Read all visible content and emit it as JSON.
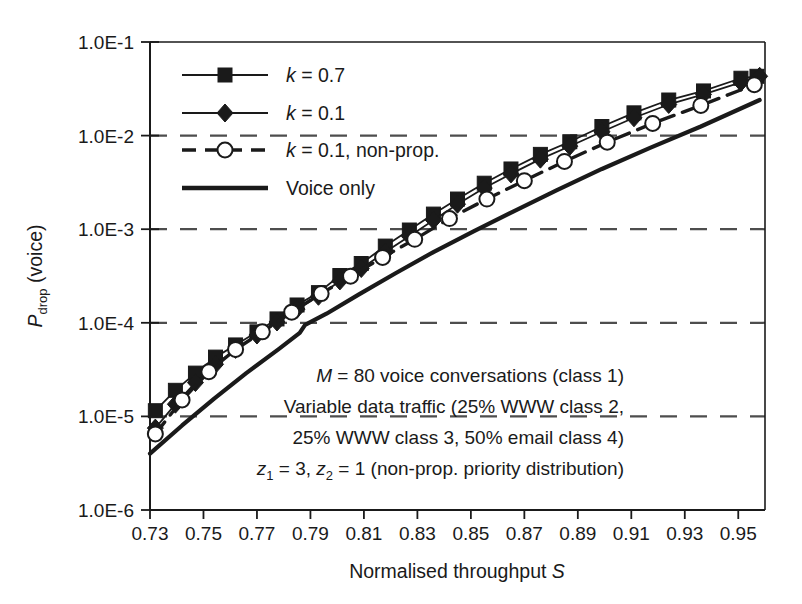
{
  "chart_data": {
    "type": "line",
    "title": "",
    "xlabel": "Normalised throughput S",
    "ylabel": "P_drop (voice)",
    "ylabel_parts": {
      "main": "P",
      "subscript": "drop",
      "suffix": " (voice)"
    },
    "xlim": [
      0.73,
      0.96
    ],
    "ylim": [
      1e-06,
      0.1
    ],
    "yscale": "log",
    "grid": "horizontal-dashed",
    "xticks": [
      "0.73",
      "0.75",
      "0.77",
      "0.79",
      "0.81",
      "0.83",
      "0.85",
      "0.87",
      "0.89",
      "0.91",
      "0.93",
      "0.95"
    ],
    "xtick_values": [
      0.73,
      0.75,
      0.77,
      0.79,
      0.81,
      0.83,
      0.85,
      0.87,
      0.89,
      0.91,
      0.93,
      0.95
    ],
    "yticks": [
      "1.0E-1",
      "1.0E-2",
      "1.0E-3",
      "1.0E-4",
      "1.0E-5",
      "1.0E-6"
    ],
    "ytick_values": [
      0.1,
      0.01,
      0.001,
      0.0001,
      1e-05,
      1e-06
    ],
    "legend_position": "upper-left-inside",
    "series": [
      {
        "name": "k = 0.7",
        "label_parts": {
          "symbol": "k",
          "rest": " = 0.7"
        },
        "marker": "square-filled",
        "linestyle": "solid",
        "color": "#1a1a1a",
        "x": [
          0.732,
          0.7395,
          0.747,
          0.7545,
          0.762,
          0.77,
          0.7775,
          0.785,
          0.793,
          0.801,
          0.809,
          0.818,
          0.827,
          0.836,
          0.845,
          0.855,
          0.865,
          0.876,
          0.887,
          0.899,
          0.911,
          0.924,
          0.937,
          0.951,
          0.957
        ],
        "y": [
          1.15e-05,
          1.9e-05,
          2.9e-05,
          4.3e-05,
          5.8e-05,
          8e-05,
          0.00011,
          0.000155,
          0.00021,
          0.00032,
          0.00043,
          0.00066,
          0.00098,
          0.00145,
          0.0021,
          0.0031,
          0.0044,
          0.0063,
          0.0086,
          0.0125,
          0.0175,
          0.024,
          0.03,
          0.041,
          0.043
        ]
      },
      {
        "name": "k = 0.1",
        "label_parts": {
          "symbol": "k",
          "rest": " = 0.1"
        },
        "marker": "diamond-filled",
        "linestyle": "solid",
        "color": "#1a1a1a",
        "x": [
          0.732,
          0.7395,
          0.747,
          0.7545,
          0.762,
          0.77,
          0.7775,
          0.785,
          0.793,
          0.801,
          0.809,
          0.818,
          0.827,
          0.836,
          0.845,
          0.855,
          0.865,
          0.876,
          0.887,
          0.899,
          0.911,
          0.924,
          0.937,
          0.951,
          0.958
        ],
        "y": [
          7.5e-06,
          1.35e-05,
          2.3e-05,
          3.6e-05,
          5.2e-05,
          7.4e-05,
          0.000102,
          0.00014,
          0.000192,
          0.00028,
          0.00038,
          0.00057,
          0.00084,
          0.00125,
          0.00185,
          0.00275,
          0.0039,
          0.0056,
          0.0077,
          0.011,
          0.0155,
          0.0215,
          0.0275,
          0.037,
          0.043
        ]
      },
      {
        "name": "k = 0.1, non-prop.",
        "label_parts": {
          "symbol": "k",
          "rest": " = 0.1, non-prop."
        },
        "marker": "circle-open",
        "linestyle": "dashed",
        "color": "#1a1a1a",
        "x": [
          0.732,
          0.742,
          0.752,
          0.762,
          0.772,
          0.783,
          0.794,
          0.805,
          0.817,
          0.829,
          0.842,
          0.856,
          0.87,
          0.885,
          0.901,
          0.918,
          0.936,
          0.956
        ],
        "y": [
          6.5e-06,
          1.5e-05,
          3e-05,
          5.2e-05,
          8e-05,
          0.00013,
          0.000205,
          0.000315,
          0.0005,
          0.00078,
          0.0013,
          0.0021,
          0.0033,
          0.0053,
          0.0085,
          0.0135,
          0.021,
          0.035
        ]
      },
      {
        "name": "Voice only",
        "label_parts": {
          "symbol": "",
          "rest": "Voice only"
        },
        "marker": "none",
        "linestyle": "solid-thick",
        "color": "#1a1a1a",
        "x": [
          0.73,
          0.742,
          0.754,
          0.766,
          0.778,
          0.786,
          0.788,
          0.796,
          0.808,
          0.822,
          0.836,
          0.851,
          0.866,
          0.882,
          0.899,
          0.917,
          0.936,
          0.958
        ],
        "y": [
          4e-06,
          8e-06,
          1.55e-05,
          2.9e-05,
          5.2e-05,
          7.8e-05,
          9.5e-05,
          0.000125,
          0.0002,
          0.00034,
          0.00057,
          0.00095,
          0.00155,
          0.0026,
          0.0044,
          0.0074,
          0.0125,
          0.024
        ]
      }
    ],
    "annotations": [
      {
        "id": "line1",
        "text": "M = 80 voice conversations (class 1)",
        "italic_prefix": "M",
        "rest": " = 80 voice conversations (class 1)"
      },
      {
        "id": "line2",
        "text": "Variable data traffic (25% WWW class 2,",
        "italic_prefix": "",
        "rest": "Variable data traffic (25% WWW class 2,"
      },
      {
        "id": "line3",
        "text": "25% WWW class 3, 50% email class 4)",
        "italic_prefix": "",
        "rest": "25% WWW class 3, 50% email class 4)"
      },
      {
        "id": "line4",
        "text": "z1 = 3, z2 = 1 (non-prop. priority distribution)",
        "italic_prefix": "",
        "rest": " = 3, "
      }
    ]
  },
  "annotation_block": {
    "line1_symbol": "M",
    "line1_rest": " = 80 voice conversations (class 1)",
    "line2": "Variable data traffic (25% WWW class 2,",
    "line3": "25% WWW class 3, 50% email class 4)",
    "line4_sym1": "z",
    "line4_sub1": "1",
    "line4_mid": " = 3, ",
    "line4_sym2": "z",
    "line4_sub2": "2",
    "line4_end": " = 1 (non-prop. priority distribution)"
  },
  "axes": {
    "x_title": "Normalised throughput S",
    "x_title_plain": "Normalised throughput ",
    "x_title_italic": "S",
    "y_title_main": "P",
    "y_title_sub": "drop",
    "y_title_suffix": " (voice)"
  },
  "colors": {
    "ink": "#1a1a1a",
    "grid": "#4d4d4d",
    "background": "#ffffff"
  }
}
